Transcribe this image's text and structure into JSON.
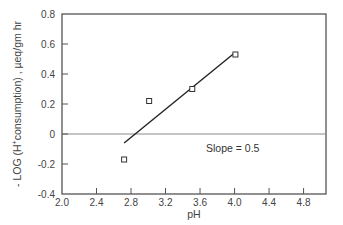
{
  "chart_data": {
    "type": "scatter",
    "title": "",
    "xlabel": "pH",
    "ylabel": "- LOG (H⁺consumption) , µeq/gm hr",
    "xlim": [
      2.0,
      5.06
    ],
    "ylim": [
      -0.4,
      0.8
    ],
    "x_ticks": [
      "2.0",
      "2.4",
      "2.8",
      "3.2",
      "3.6",
      "4.0",
      "4.4",
      "4.8"
    ],
    "y_ticks": [
      "0.8",
      "0.6",
      "0.4",
      "0.2",
      "0",
      "-0.2",
      "-0.4"
    ],
    "grid": false,
    "legend": null,
    "series": [
      {
        "name": "measured",
        "marker": "open-square",
        "x": [
          2.72,
          3.01,
          3.51,
          4.01
        ],
        "y": [
          -0.17,
          0.22,
          0.3,
          0.53
        ]
      },
      {
        "name": "fit line",
        "type": "line",
        "x": [
          2.72,
          4.0
        ],
        "y": [
          -0.06,
          0.54
        ]
      }
    ],
    "reference_lines": [
      {
        "axis": "y",
        "value": 0
      }
    ],
    "annotations": [
      {
        "text": "Slope = 0.5",
        "x": 3.67,
        "y": -0.12
      }
    ]
  },
  "labels": {
    "xlabel": "pH",
    "ylabel_main": "- LOG (H",
    "ylabel_sup": "+",
    "ylabel_rest": "consumption) ,  µeq/gm hr",
    "annotation": "Slope = 0.5"
  }
}
